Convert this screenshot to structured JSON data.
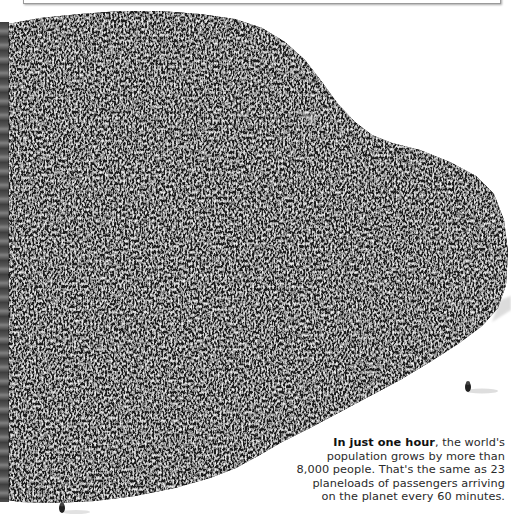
{
  "caption": {
    "lead_bold": "In just one hour",
    "rest": ", the world's population grows by more than 8,000 people. That's the same as 23 planeloads of passengers arriving on the planet every 60 minutes.",
    "lines": [
      "population grows by more than",
      "8,000 people. That's the same as 23",
      "planeloads of passengers arriving",
      "on the planet every 60 minutes."
    ],
    "first_line_rest": ", the world's"
  },
  "figure": {
    "lone_people_count": 2,
    "colors": {
      "background": "#ffffff",
      "crowd_dark": "#1c1c1c",
      "crowd_light": "#d8d8d8",
      "text": "#2a2a2a"
    }
  }
}
